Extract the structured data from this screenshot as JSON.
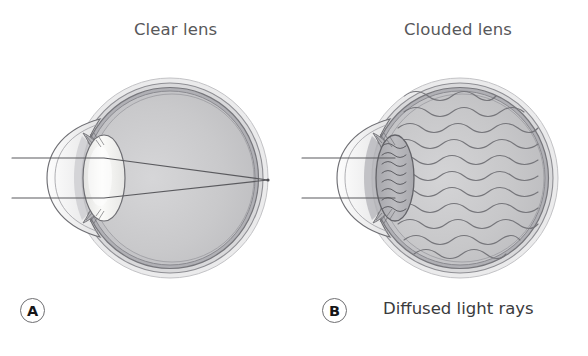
{
  "figure": {
    "kind": "medical-illustration",
    "background_color": "#ffffff",
    "panels": [
      {
        "id": "A",
        "marker": "A",
        "title": "Clear lens",
        "caption": "",
        "lens_state": "clear",
        "light_behavior": "converging",
        "ray_count": 2
      },
      {
        "id": "B",
        "marker": "B",
        "title": "Clouded lens",
        "caption": "Diffused light rays",
        "lens_state": "clouded",
        "light_behavior": "diffused",
        "ray_count": 2
      }
    ],
    "colors": {
      "title_text": "#58585a",
      "caption_text": "#3b3b3d",
      "marker_text": "#161618",
      "marker_ring": "#6f6f72",
      "sclera_outer": "#e9e9ea",
      "sclera_mid": "#d2d2d4",
      "choroid": "#a9a9ad",
      "vitreous": "#c9c9cb",
      "lens_clear": "#f4f4f2",
      "lens_clouded": "#b2b2b6",
      "outline": "#6b6b6f",
      "ray_line": "#5a5a5e"
    }
  }
}
